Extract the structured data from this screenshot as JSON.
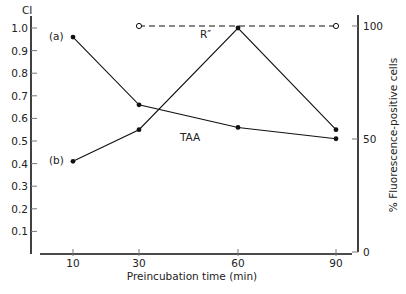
{
  "chart_data": {
    "type": "line",
    "title": "",
    "xlabel": "Preincubation time (min)",
    "ylabel_left": "CI",
    "ylabel_right": "% Fluorescence-positive cells",
    "x": [
      10,
      30,
      60,
      90
    ],
    "x_ticks": [
      "10",
      "30",
      "60",
      "90"
    ],
    "ylim_left": [
      0,
      1.0
    ],
    "yticks_left": [
      "0.1",
      "0.2",
      "0.3",
      "0.4",
      "0.5",
      "0.6",
      "0.7",
      "0.8",
      "0.9",
      "1.0"
    ],
    "ylim_right": [
      0,
      100
    ],
    "yticks_right": [
      "0",
      "50",
      "100"
    ],
    "grid": false,
    "series": [
      {
        "name": "(a)",
        "axis": "left",
        "marker": "filled",
        "style": "solid",
        "x": [
          10,
          30,
          60,
          90
        ],
        "values": [
          0.96,
          0.66,
          0.56,
          0.51
        ]
      },
      {
        "name": "(b)",
        "axis": "left",
        "marker": "filled",
        "style": "solid",
        "x": [
          10,
          30,
          60,
          90
        ],
        "values": [
          0.41,
          0.55,
          1.0,
          0.55
        ]
      },
      {
        "name": "R″",
        "axis": "right",
        "marker": "open",
        "style": "dashed",
        "x": [
          30,
          90
        ],
        "values": [
          100,
          100
        ]
      }
    ],
    "annotations": [
      {
        "text": "(a)",
        "series": "(a)"
      },
      {
        "text": "(b)",
        "series": "(b)"
      },
      {
        "text": "R″",
        "series": "R″"
      },
      {
        "text": "TAA",
        "series": "(a)"
      }
    ]
  }
}
